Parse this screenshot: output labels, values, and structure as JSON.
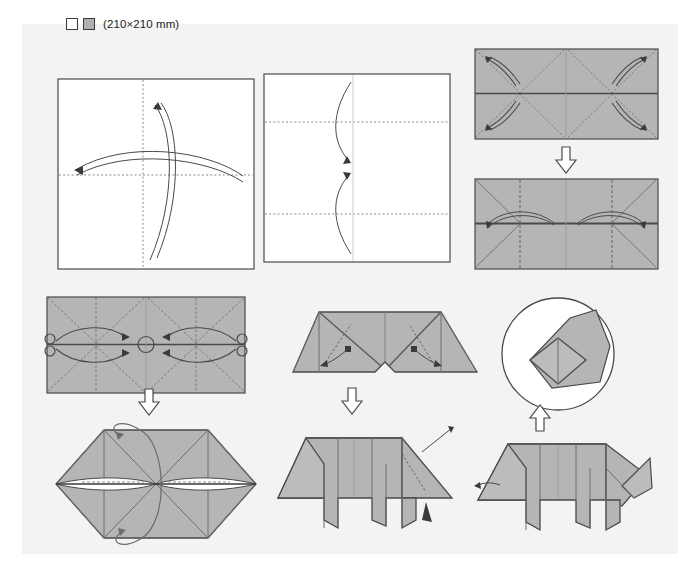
{
  "document": {
    "kind": "origami-instruction-diagram",
    "subject": "folded paper animal (pig) step-by-step folding sequence",
    "background_color": "#f3f3f3",
    "page_color": "#ffffff"
  },
  "legend": {
    "swatch_white_name": "white-side-swatch",
    "swatch_gray_name": "colored-side-swatch",
    "label": "(210×210 mm)"
  },
  "colors": {
    "paper_gray": "#b5b5b5",
    "paper_gray_dark": "#9e9e9e",
    "paper_white": "#ffffff",
    "outline": "#4a4a4a",
    "crease_dotted": "#8a8a8a",
    "arrow": "#3a3a3a"
  },
  "steps": [
    {
      "number": 1,
      "name": "step-1-square-diagonal-creases",
      "shape": "white square",
      "description": "Square sheet, white side up, with vertical and horizontal centre creases shown dotted; two curved arrows indicate folding and unfolding in both directions."
    },
    {
      "number": 2,
      "name": "step-2-quarter-creases",
      "shape": "white square",
      "description": "Square with horizontal quarter creases dotted; two curved arrows bring top and bottom edges toward the horizontal centre line."
    },
    {
      "number": 3,
      "name": "step-3-rectangle-corner-folds",
      "shape": "gray rectangle",
      "description": "Folded rectangle, coloured side up, with diagonal creases in all four quadrants; four curved corner arrows fold the corners inward."
    },
    {
      "number": 4,
      "name": "step-4-rectangle-center-folds",
      "shape": "gray rectangle",
      "description": "Rectangle with diagonal creases and vertical dotted quarter lines; shallow curved arrows run along the horizontal centre line."
    },
    {
      "number": 5,
      "name": "step-5-collapse-to-center",
      "shape": "gray rectangle",
      "description": "Rectangle with circled reference points at left edge, centre and right edge; four arrows converge toward the centre to collapse the model."
    },
    {
      "number": 6,
      "name": "step-6-hexagon-turn-over",
      "shape": "gray hexagon",
      "description": "Collapsed hexagonal form with an X crease pattern and a white lens-shaped opening at the centre; a looping arrow indicates turning the model over."
    },
    {
      "number": 7,
      "name": "step-7-w-shape-legs",
      "shape": "gray w-shape",
      "description": "Flattened W shape with a notch at the bottom centre; dotted lines and short arrows mark the inside reverse folds that form the legs."
    },
    {
      "number": 8,
      "name": "step-8-body-with-tail",
      "shape": "gray animal body",
      "description": "Four-legged body shape; a thin pointer arrow and a small solid triangle mark the tail fold at the right-hand end."
    },
    {
      "number": 9,
      "name": "step-9-head-detail-circle",
      "shape": "circular detail view",
      "description": "Magnified circular detail of the head showing a diagonal coloured wedge with an inner diamond-shaped fold."
    },
    {
      "number": 10,
      "name": "step-10-finished-pig",
      "shape": "gray pig figure",
      "description": "Completed origami pig seen from the side with head, snout, ear, four legs and a small pointed tail."
    }
  ],
  "separators": [
    {
      "name": "arrow-separator-right-column",
      "direction": "down"
    },
    {
      "name": "arrow-separator-left-column",
      "direction": "down"
    },
    {
      "name": "arrow-separator-middle-column",
      "direction": "down"
    },
    {
      "name": "arrow-separator-right-bottom",
      "direction": "up"
    }
  ]
}
